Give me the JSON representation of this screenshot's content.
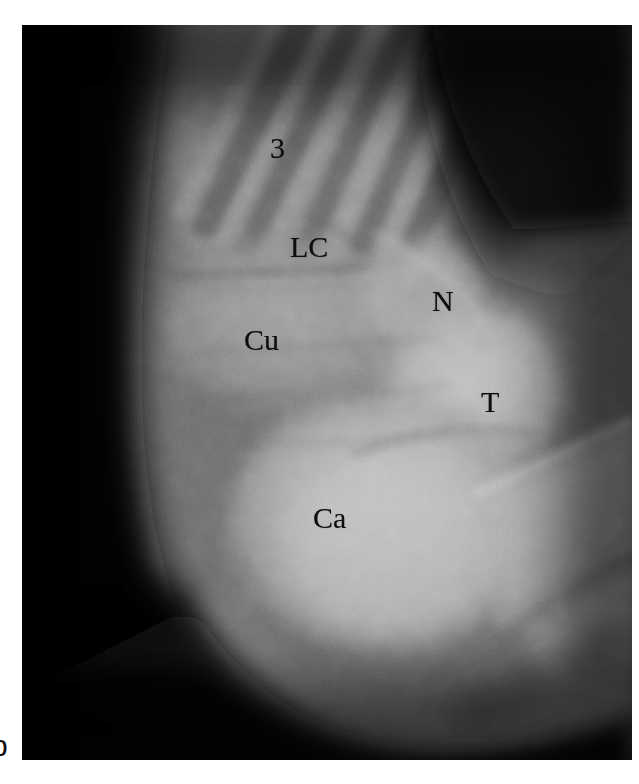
{
  "figure": {
    "panel_label": "b",
    "modality": "radiograph",
    "view": "oblique foot",
    "background_color": "#ffffff",
    "plate": {
      "left": 22,
      "top": 25,
      "width": 610,
      "height": 735,
      "border_color": "#050505"
    }
  },
  "annotations": [
    {
      "id": "third-metatarsal",
      "text": "3",
      "name": "label-third-metatarsal",
      "x": 248,
      "y": 108,
      "font_size": 30,
      "color": "#0d0d0d"
    },
    {
      "id": "lateral-cuneiform",
      "text": "LC",
      "name": "label-lateral-cuneiform",
      "x": 268,
      "y": 207,
      "font_size": 30,
      "color": "#0d0d0d"
    },
    {
      "id": "cuboid",
      "text": "Cu",
      "name": "label-cuboid",
      "x": 222,
      "y": 300,
      "font_size": 30,
      "color": "#0d0d0d"
    },
    {
      "id": "navicular",
      "text": "N",
      "name": "label-navicular",
      "x": 410,
      "y": 261,
      "font_size": 30,
      "color": "#0d0d0d"
    },
    {
      "id": "talus",
      "text": "T",
      "name": "label-talus",
      "x": 459,
      "y": 362,
      "font_size": 30,
      "color": "#0d0d0d"
    },
    {
      "id": "calcaneus",
      "text": "Ca",
      "name": "label-calcaneus",
      "x": 291,
      "y": 478,
      "font_size": 30,
      "color": "#0d0d0d"
    }
  ],
  "greyscale_palette": {
    "air_black": "#070707",
    "deep_shadow": "#151515",
    "soft_tissue_dark": "#4a4a4a",
    "soft_tissue_mid": "#6e6e6e",
    "midfoot_grey": "#8a8a8a",
    "bone_grey": "#9a9a9a",
    "bone_bright": "#b4b4b4",
    "bone_brightest": "#c6c6c6",
    "cortical_highlight": "#d2d2d2"
  }
}
